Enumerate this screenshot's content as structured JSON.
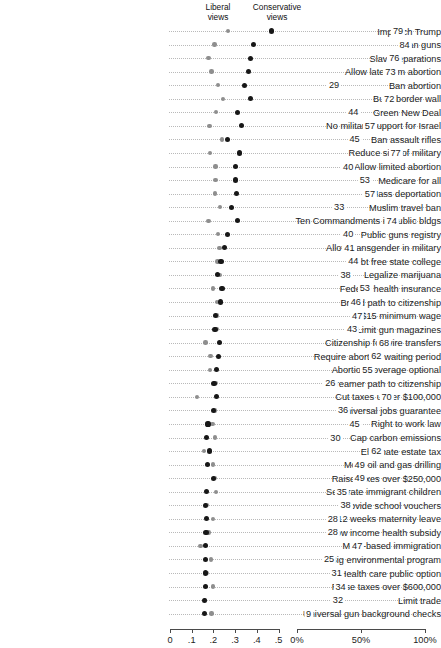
{
  "header": {
    "liberal_line1": "Liberal",
    "liberal_line2": "views",
    "conservative_line1": "Conservative",
    "conservative_line2": "views"
  },
  "axes": {
    "left": {
      "label": "",
      "ticks": [
        "0",
        ".1",
        ".2",
        ".3",
        ".4",
        ".5"
      ],
      "tick_values": [
        0,
        0.1,
        0.2,
        0.3,
        0.4,
        0.5
      ],
      "min": 0,
      "max": 0.5
    },
    "right": {
      "label": "",
      "ticks": [
        "0%",
        "50%",
        "100%"
      ],
      "tick_values": [
        0,
        50,
        100
      ],
      "min": 0,
      "max": 100
    }
  },
  "colors": {
    "liberal": "#8e8e8e",
    "conservative": "#171717",
    "grid": "#b9b9b9",
    "axis": "#4a4a4a",
    "text": "#1c1c1c"
  },
  "chart_data": {
    "type": "scatter",
    "title": "",
    "subtitle": "",
    "xlabel": "",
    "ylabel": "",
    "xlim": [
      0,
      0.5
    ],
    "xlim_right": [
      0,
      100
    ],
    "grid": true,
    "legend_position": "top",
    "series": [
      {
        "name": "Liberal views",
        "color": "#8e8e8e"
      },
      {
        "name": "Conservative views",
        "color": "#171717"
      }
    ],
    "right_series": {
      "name": "Percent support",
      "unit": "%"
    },
    "categories": [
      "Impeach Trump",
      "Ban guns",
      "Slave reparations",
      "Allow late term abortion",
      "Ban abortion",
      "Build border wall",
      "Green New Deal",
      "No military support for Israel",
      "Ban assault rifles",
      "Reduce size of military",
      "Allow limited abortion",
      "Medicare for all",
      "Mass deportation",
      "Muslim travel ban",
      "Ten Commandments in public bldgs",
      "Public guns registry",
      "Allow transgender in military",
      "Debt free state college",
      "Legalize marijuana",
      "Federal health insurance",
      "Broad path to citizenship",
      "$15 minimum wage",
      "Limit gun magazines",
      "Citizenship for wire transfers",
      "Require abortion waiting period",
      "Abortion coverage optional",
      "Dreamer path to citizenship",
      "Cut taxes under $100,000",
      "Universal jobs guarantee",
      "Right to work law",
      "Cap carbon emissions",
      "Eliminate estate tax",
      "More oil and gas drilling",
      "Raise taxes over $250,000",
      "Separate immigrant children",
      "Provide school vouchers",
      "12 weeks maternity leave",
      "Low income health subsidy",
      "Merit-based immigration",
      "Big environmental program",
      "Health care public option",
      "Raise taxes over $600,000",
      "Limit trade",
      "Universal gun background checks"
    ],
    "liberal_values": [
      0.268,
      0.205,
      0.178,
      0.192,
      0.222,
      0.245,
      0.212,
      0.182,
      0.24,
      0.183,
      0.21,
      0.209,
      0.207,
      0.231,
      0.178,
      0.222,
      0.228,
      0.219,
      0.231,
      0.197,
      0.218,
      0.218,
      0.214,
      0.163,
      0.187,
      0.183,
      0.213,
      0.124,
      0.208,
      0.196,
      0.207,
      0.157,
      0.199,
      0.208,
      0.212,
      0.168,
      0.197,
      0.178,
      0.14,
      0.19,
      0.168,
      0.198,
      0.162,
      0.192
    ],
    "conservative_values": [
      0.468,
      0.385,
      0.372,
      0.36,
      0.345,
      0.37,
      0.31,
      0.33,
      0.265,
      0.32,
      0.3,
      0.3,
      0.305,
      0.285,
      0.31,
      0.265,
      0.252,
      0.235,
      0.22,
      0.24,
      0.232,
      0.21,
      0.207,
      0.23,
      0.222,
      0.215,
      0.203,
      0.213,
      0.2,
      0.175,
      0.17,
      0.182,
      0.172,
      0.2,
      0.168,
      0.165,
      0.168,
      0.166,
      0.164,
      0.163,
      0.162,
      0.162,
      0.16,
      0.158
    ],
    "percent_values": [
      79,
      84,
      76,
      73,
      29,
      72,
      44,
      57,
      45,
      77,
      40,
      53,
      57,
      33,
      74,
      40,
      41,
      44,
      38,
      53,
      46,
      47,
      43,
      68,
      62,
      55,
      26,
      70,
      36,
      45,
      30,
      62,
      49,
      49,
      35,
      38,
      28,
      28,
      47,
      25,
      31,
      34,
      32,
      9
    ]
  },
  "layout": {
    "row_top": 26.5,
    "row_step": 13.55,
    "label_right_px": 164,
    "left_axis_x0": 170,
    "left_axis_x1": 278.5,
    "right_axis_x0": 297,
    "right_axis_x1": 425,
    "axis_y": 629
  }
}
